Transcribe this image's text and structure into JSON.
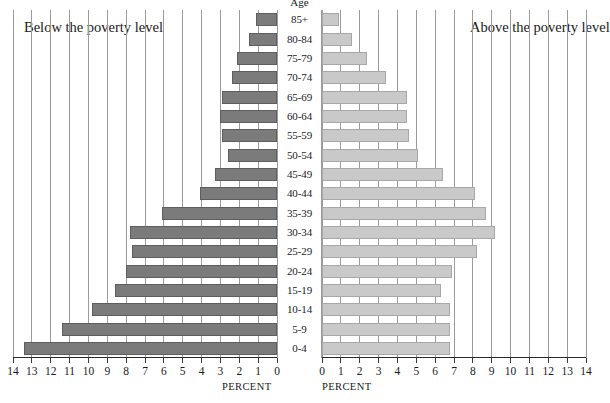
{
  "chart_data": {
    "type": "bar",
    "subtype": "population-pyramid",
    "title": "",
    "xlabel": "PERCENT",
    "ylabel": "Age",
    "categories": [
      "85+",
      "80-84",
      "75-79",
      "70-74",
      "65-69",
      "60-64",
      "55-59",
      "50-54",
      "45-49",
      "40-44",
      "35-39",
      "30-34",
      "25-29",
      "20-24",
      "15-19",
      "10-14",
      "5-9",
      "0-4"
    ],
    "axis_label_left": "PERCENT",
    "axis_label_right": "PERCENT",
    "xlim_left": [
      14,
      0
    ],
    "xlim_right": [
      0,
      14
    ],
    "tick_step": 1,
    "grid": true,
    "legend_position": "inline-panel-captions",
    "series": [
      {
        "name": "Below the poverty level",
        "side": "left",
        "color": "#7b7b7b",
        "values": [
          1.1,
          1.5,
          2.1,
          2.4,
          2.9,
          3.0,
          2.9,
          2.6,
          3.3,
          4.1,
          6.1,
          7.8,
          7.7,
          8.0,
          8.6,
          9.8,
          11.4,
          13.4
        ]
      },
      {
        "name": "Above the poverty level",
        "side": "right",
        "color": "#c9c9c9",
        "values": [
          0.9,
          1.6,
          2.4,
          3.4,
          4.5,
          4.5,
          4.6,
          5.1,
          6.4,
          8.1,
          8.7,
          9.2,
          8.2,
          6.9,
          6.3,
          6.8,
          6.8,
          6.8
        ]
      }
    ],
    "ticks_left": [
      "14",
      "13",
      "12",
      "11",
      "10",
      "9",
      "8",
      "7",
      "6",
      "5",
      "4",
      "3",
      "2",
      "1",
      "0"
    ],
    "ticks_right": [
      "0",
      "1",
      "2",
      "3",
      "4",
      "5",
      "6",
      "7",
      "8",
      "9",
      "10",
      "11",
      "12",
      "13",
      "14"
    ]
  },
  "captions": {
    "left": "Below the poverty level",
    "right": "Above the poverty level"
  },
  "age_header": "Age",
  "colors": {
    "below_poverty_bar": "#7b7b7b",
    "above_poverty_bar": "#c9c9c9",
    "gridline": "#9b9b9b",
    "axis": "#2a2a2a",
    "background": "#ffffff"
  }
}
